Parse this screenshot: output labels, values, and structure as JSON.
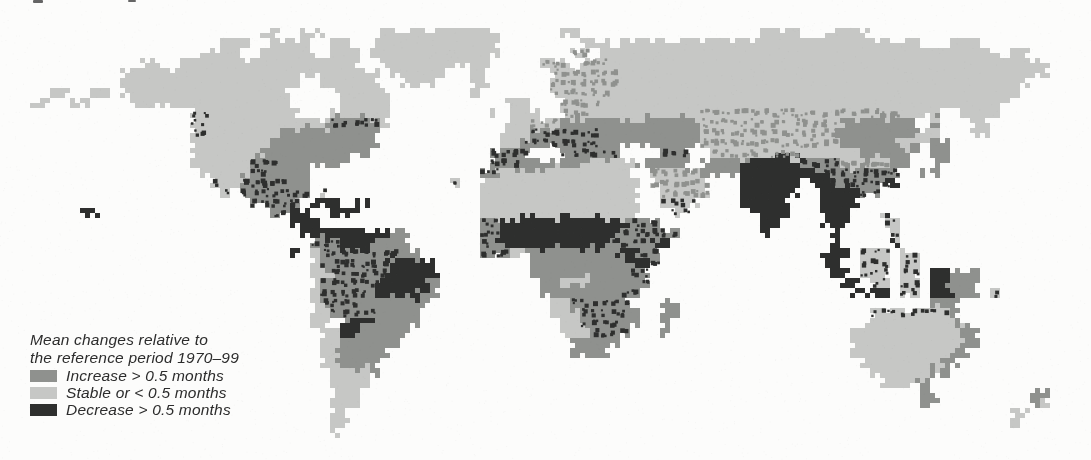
{
  "page": {
    "background": "#fcfcfb"
  },
  "legend": {
    "caption_line1": "Mean changes relative to",
    "caption_line2": "the reference period 1970–99",
    "text_color": "#2c2c2c",
    "items": [
      {
        "key": "increase",
        "label": "Increase > 0.5 months",
        "color": "#8f918e"
      },
      {
        "key": "stable",
        "label": "Stable or < 0.5 months",
        "color": "#c6c7c5"
      },
      {
        "key": "decrease",
        "label": "Decrease > 0.5 months",
        "color": "#2e2f2e"
      }
    ]
  },
  "map": {
    "kind": "world raster map, three-class choropleth",
    "palette": {
      "paper": "#fcfcfb",
      "stable": "#c6c7c5",
      "increase": "#8f918e",
      "decrease": "#2e2f2e"
    },
    "cell_size": 10,
    "origin_y": 28,
    "cols": 109,
    "rows_count": 41,
    "class_codes": {
      ".": "ocean",
      "l": "stable",
      "m": "increase",
      "d": "decrease",
      "x": "increase with decrease mottle",
      "y": "stable with increase mottle",
      "z": "stable with decrease specks"
    },
    "rows": [
      "26. 2l 2. 3l 5. 12l 6. 2l 18. 4l 2. 5l 22.",
      "22. 3l 2. 4l 2. 2l 2. 13l 8. 3l 1. 30l 3. 3l 11.",
      "20. 4l 2. 6l 1. 3l 1. 13l 7. 2y 1. 40l 1. 2l 6.",
      "14. 2l 2. 18l 2. 11l 5. 3y 1. 3y 44l 4.",
      "12. 26l 1. 6l 2. 2l 6. 7y 43l 4.",
      "12. 18l 2. 6l 2. 4l 3. 2l 6. 7y 41l 6.",
      "5. 2l 2. 2l 1. 17l 4. 6l 8. 1l 7. 6y 41l 7.",
      "3. 2l 2. 2l 4. 16l 5. 5l 11. 3l 3. 4y 41l 8.",
      "19. 2z 9l 3. 6l 10. 1l 1. 3l 2. 3y 11l 20y 4l 2. 4l 9.",
      "19. 2z 12l 5x 1l 11. 3l 3y 14m 14y 8m 1. 1m 3. 2l 10.",
      "19. 2z 7l 10m 12. 3l 7x 10m 14y 8m 2l 3. 2l 10.",
      "19. 8l 11m 12. 2l 8x 10m 14y 6m 3l 2m 14.",
      "19. 7l 11m 12. 4x 3. 2x 4x 4. 3x 2. 9y 6l 6m 1. 2m 14.",
      "19. 6l 3x 7m 14. 3x 6m 6l 5m 1. 5m 5d 4x 5y 2m 2. 2m 14.",
      "20. 5l 2x 4m 17. 2x 13l 2. 5y 4m 8d 8x 2. 2m 15.",
      "21. 1z 2l 5x 2m 14. 1z 2. 16l 1. 6y 3. 6d 1. 2d 6x 1d 19.",
      "22. 1z 1. 7x 1. 1z 15. 16l 2. 5y 3. 6d 2. 4d 2x 21.",
      "25. 5x 1. 3d 1. 2d 11. 16l 2. 4z 4. 5d 3. 4d 23.",
      "8. 2d 17. 2x 2d 2. 3d 12. 16l 3. 2z 6. 4d 3. 3d 3. 1d 20.",
      "29. 3d 16. 2x 13d 3x 10. 2d 4. 3d 3. 2z 19.",
      "30. 9d 2m 7. 2x 12d 6x 8. 1d 6. 1d 5. 1z 19.",
      "31. 3x 3d 4m 7. 2x 11d 4x 2d 11. 1d 4. 1d 5. 1d 19.",
      "29. 1d 1. 1l 8x 2m 6. 3x 2l 9m 2d 2x 16. 3d 1. 3z 1. 2z 17.",
      "31. 1l 7x 5d 9. 10m 2d 1x 16. 2d 2. 3z 1. 2z 17.",
      "31. 2l 6x 5d 9. 10m 2x 18. 2d 1. 3z 1. 2z 1. 2d 3m 11.",
      "31. 1l 6x 5d 1m 10. 2m 3l 5m 1x 19. 2d 1. 2z 1. 2z 1. 2d 3m 11.",
      "31. 1l 5x 5d 2m 10. 8m 2x 21. 4d 1. 2z 1. 2d 3m 1. 1z 9.",
      "31. 1l 4x 7m 12. 2l 6x 3. 2m 25. 3m 13.",
      "31. 2l 5x 4m 13. 3l 5x 1m 2. 2m 19. 8z 1m 13.",
      "31. 2l 1. 3d 5m 14. 2l 4x 2m 2. 1m 19. 10l 1m 12.",
      "32. 2l 2d 5m 15. 3l 4x 3. 1m 18. 11l 2m 11.",
      "32. 2l 6m 17. 5m 23. 11l 2m 11.",
      "32. 2l 5m 18. 4m 24. 10l 2m 12.",
      "32. 2l 4m 48. 8l 2m 13.",
      "33. 4l 1m 49. 6l 2m 14.",
      "33. 4l 51. 4l 1m 16.",
      "33. 3l 56. 2m 9. 2m 4.",
      "33. 3l 56. 2m 9. 1m 1l 4.",
      "33. 2l 66. 2l 6.",
      "33. 2l 66. 1l 7.",
      "33. 1l 75."
    ]
  },
  "artifacts": {
    "top_text_remnants": [
      {
        "x": 33,
        "y": 0,
        "w": 10,
        "h": 3
      },
      {
        "x": 128,
        "y": 0,
        "w": 8,
        "h": 2
      }
    ]
  }
}
